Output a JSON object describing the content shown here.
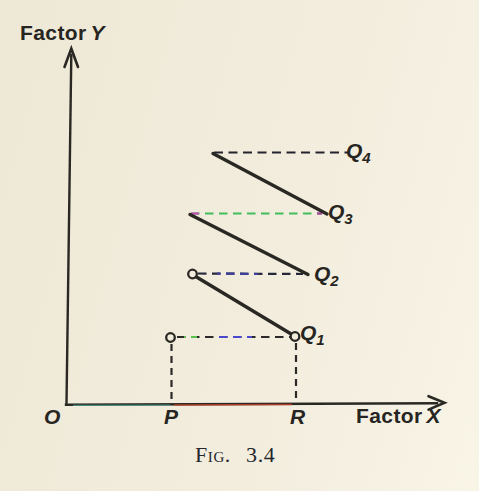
{
  "figure": {
    "caption": {
      "text": "Fig. 3.4",
      "x": 195,
      "y": 444
    },
    "labels": {
      "factor_y": {
        "word": "Factor",
        "var": "Y",
        "x": 20,
        "y": 22
      },
      "factor_x": {
        "word": "Factor",
        "var": "X",
        "x": 356,
        "y": 405
      },
      "origin": {
        "text": "O",
        "x": 44,
        "y": 406
      },
      "p": {
        "text": "P",
        "x": 164,
        "y": 406
      },
      "r": {
        "text": "R",
        "x": 290,
        "y": 406
      },
      "q1": {
        "main": "Q",
        "sub": "1",
        "x": 300,
        "y": 322
      },
      "q2": {
        "main": "Q",
        "sub": "2",
        "x": 314,
        "y": 263
      },
      "q3": {
        "main": "Q",
        "sub": "3",
        "x": 328,
        "y": 201
      },
      "q4": {
        "main": "Q",
        "sub": "4",
        "x": 346,
        "y": 140
      }
    }
  },
  "colors": {
    "paper": "#f1ecdc",
    "ink": "#2a2823",
    "caption_ink": "#26262e",
    "fringe_green": "#55c34c",
    "fringe_blue": "#4a48cc",
    "fringe_navy": "#3f3f9e",
    "fringe_magenta": "#c24fb4",
    "fringe_teal": "#4fae9d",
    "fringe_red": "#c8432b"
  },
  "diagram": {
    "width": 479,
    "height": 491,
    "ink": "#2a2823",
    "bg": "#f1ecdc",
    "axes": [
      {
        "name": "y-axis",
        "x1": 66.5,
        "y1": 404,
        "x2": 71.3,
        "y2": 55,
        "w": 2.4
      },
      {
        "name": "x-axis",
        "x1": 66,
        "y1": 404.8,
        "x2": 437,
        "y2": 403.2,
        "w": 2.4
      }
    ],
    "arrowheads": [
      {
        "name": "y-axis-arrowhead",
        "points": "64.5,67 71.3,48.5 78,67"
      },
      {
        "name": "x-axis-arrowhead",
        "points": "428.5,396.2 444.5,402.8 428.5,409.6"
      }
    ],
    "fringes": [
      {
        "name": "x-axis-tint-teal",
        "x1": 73,
        "y1": 405.4,
        "x2": 170,
        "y2": 405.1,
        "color": "#4fae9d",
        "w": 1.4,
        "opacity": 0.7
      },
      {
        "name": "x-axis-tint-red",
        "x1": 174,
        "y1": 405.1,
        "x2": 292,
        "y2": 404.6,
        "color": "#c8432b",
        "w": 1.5,
        "opacity": 0.8
      }
    ],
    "solid_lines": [
      {
        "name": "segment-to-q3",
        "x1": 213,
        "y1": 153.5,
        "x2": 327,
        "y2": 214,
        "w": 3.4
      },
      {
        "name": "segment-to-q2",
        "x1": 190,
        "y1": 214.5,
        "x2": 308,
        "y2": 274.5,
        "w": 3.4
      },
      {
        "name": "segment-to-q1",
        "x1": 194,
        "y1": 275.5,
        "x2": 294.5,
        "y2": 336,
        "w": 3.4
      }
    ],
    "dashed_lines": [
      {
        "name": "dash-q4",
        "x1": 214,
        "y1": 152.5,
        "x2": 349,
        "y2": 152.5,
        "color": "#23232e",
        "dash": "9 5.5",
        "w": 2.2
      },
      {
        "name": "dash-q3",
        "x1": 191,
        "y1": 213.5,
        "x2": 322,
        "y2": 213.5,
        "color": "#43bd5c",
        "dash": "8.5 5.5",
        "w": 2.2,
        "accents": [
          {
            "x1": 191,
            "x2": 199,
            "color": "#c24fb4"
          },
          {
            "x1": 312,
            "x2": 322,
            "color": "#b03ea4"
          }
        ]
      },
      {
        "name": "dash-q2",
        "x1": 198,
        "y1": 273.5,
        "x2": 303,
        "y2": 274,
        "color": "#27273a",
        "dash": "8.5 5.5",
        "w": 2.2,
        "accents": [
          {
            "x1": 217,
            "x2": 258,
            "color": "#3f3f9e"
          }
        ]
      },
      {
        "name": "dash-q1",
        "x1": 177,
        "y1": 337,
        "x2": 290,
        "y2": 337,
        "color": "#2a2a28",
        "dash": "8.5 5.5",
        "w": 2.2,
        "accents": [
          {
            "x1": 184,
            "x2": 197,
            "color": "#57c34c"
          },
          {
            "x1": 215,
            "x2": 252,
            "color": "#4a48cc"
          }
        ]
      },
      {
        "name": "dash-vertical-p",
        "x1": 171.5,
        "y1": 344,
        "x2": 171.5,
        "y2": 402,
        "color": "#2a2a28",
        "dash": "7 5",
        "w": 2.2
      },
      {
        "name": "dash-vertical-r",
        "x1": 296,
        "y1": 343,
        "x2": 296,
        "y2": 402,
        "color": "#2a2a28",
        "dash": "7 5",
        "w": 2.2
      }
    ],
    "circles": [
      {
        "name": "point-above-p",
        "cx": 170.5,
        "cy": 337.5,
        "r": 4.3
      },
      {
        "name": "point-q1",
        "cx": 295,
        "cy": 336.5,
        "r": 4.3
      },
      {
        "name": "point-q2-start",
        "cx": 192.5,
        "cy": 274,
        "r": 4.3
      }
    ]
  }
}
